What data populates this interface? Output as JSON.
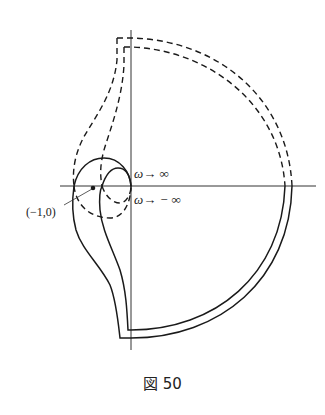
{
  "figure": {
    "caption": "図 50",
    "labels": {
      "omega_pos": "ω→ ∞",
      "omega_neg": "ω→ − ∞",
      "critical_point": "(−1,0)"
    },
    "colors": {
      "ink": "#1a1a1a",
      "background": "#ffffff"
    }
  }
}
